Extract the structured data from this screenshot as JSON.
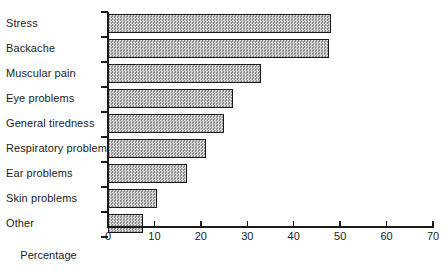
{
  "chart_data": {
    "type": "bar",
    "orientation": "horizontal",
    "title": "",
    "subtitle": "",
    "xlabel": "Percentage",
    "ylabel": "",
    "categories": [
      "Stress",
      "Backache",
      "Muscular pain",
      "Eye problems",
      "General tiredness",
      "Respiratory problems",
      "Ear problems",
      "Skin problems",
      "Other"
    ],
    "values": [
      48,
      47.5,
      33,
      27,
      25,
      21,
      17,
      10.5,
      7.5
    ],
    "xlim": [
      0,
      70
    ],
    "xticks": [
      0,
      10,
      20,
      30,
      40,
      50,
      60,
      70
    ],
    "xtick_labels": [
      "0",
      "10",
      "20",
      "30",
      "40",
      "50",
      "60",
      "70"
    ],
    "grid": false,
    "legend": null,
    "bar_fill": "#b9b9b9",
    "bar_edge": "#1a1a1a",
    "axis_color": "#1a1a1a",
    "background": "#ffffff"
  }
}
